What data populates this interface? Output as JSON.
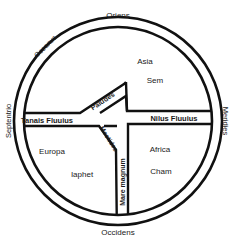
{
  "map": {
    "type": "T-O map",
    "colors": {
      "ink": "#111111",
      "background": "#ffffff"
    },
    "cardinal": {
      "top": "Oriens",
      "bottom": "Occidens",
      "left": "Septentrio",
      "right": "Meridies"
    },
    "ocean": "Oceanus",
    "continents": [
      {
        "name": "Asia",
        "son": "Sem"
      },
      {
        "name": "Europa",
        "son": "Iaphet"
      },
      {
        "name": "Africa",
        "son": "Cham"
      }
    ],
    "waters": {
      "paludes": "Paludes",
      "tanais": "Tanais Fluuius",
      "nilus": "Nilus Fluuius",
      "maeotides": "Meotides",
      "mare_magnum": "Mare magnum"
    }
  }
}
